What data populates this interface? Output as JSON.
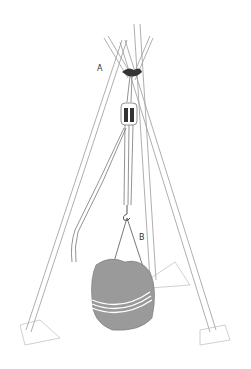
{
  "figure": {
    "labels": {
      "a": "A",
      "b": "B"
    },
    "colors": {
      "background": "#ffffff",
      "line": "#8a8a8a",
      "boulder": "#9a9a9a",
      "rope": "#6f6f6f",
      "dark": "#333333"
    }
  }
}
